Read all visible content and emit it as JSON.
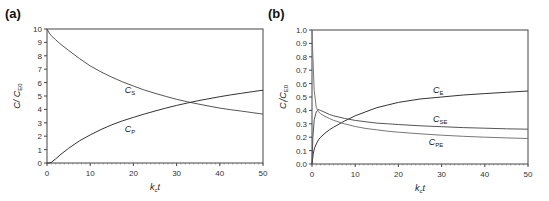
{
  "chart_data": [
    {
      "panel_label": "(a)",
      "type": "line",
      "xlabel": "k_c t",
      "ylabel": "C / C_E0",
      "xlim": [
        0,
        50
      ],
      "ylim": [
        0,
        10
      ],
      "xticks": [
        0,
        10,
        20,
        30,
        40,
        50
      ],
      "yticks": [
        0,
        1,
        2,
        3,
        4,
        5,
        6,
        7,
        8,
        9,
        10
      ],
      "grid": false,
      "series": [
        {
          "name": "C_S",
          "label": "C",
          "sub": "S",
          "label_pos": [
            18,
            5.2
          ],
          "x": [
            0,
            0.5,
            1,
            2,
            3,
            5,
            7.5,
            10,
            12.5,
            15,
            17.5,
            20,
            22.5,
            25,
            27.5,
            30,
            32.5,
            35,
            37.5,
            40,
            42.5,
            45,
            47.5,
            50
          ],
          "y": [
            10,
            9.7,
            9.5,
            9.2,
            8.9,
            8.4,
            7.8,
            7.25,
            6.8,
            6.4,
            6.05,
            5.75,
            5.45,
            5.2,
            4.97,
            4.75,
            4.57,
            4.4,
            4.25,
            4.1,
            3.98,
            3.87,
            3.76,
            3.65
          ]
        },
        {
          "name": "C_P",
          "label": "C",
          "sub": "P",
          "label_pos": [
            18,
            2.3
          ],
          "x": [
            0,
            0.5,
            1,
            2,
            3,
            5,
            7.5,
            10,
            12.5,
            15,
            17.5,
            20,
            22.5,
            25,
            27.5,
            30,
            32.5,
            35,
            37.5,
            40,
            42.5,
            45,
            47.5,
            50
          ],
          "y": [
            0,
            0,
            0.05,
            0.3,
            0.6,
            1.1,
            1.65,
            2.1,
            2.5,
            2.85,
            3.15,
            3.4,
            3.65,
            3.88,
            4.1,
            4.3,
            4.48,
            4.65,
            4.8,
            4.95,
            5.08,
            5.2,
            5.32,
            5.43
          ]
        }
      ]
    },
    {
      "panel_label": "(b)",
      "type": "line",
      "xlabel": "k_c t",
      "ylabel": "C_i / C_E0",
      "xlim": [
        0,
        50
      ],
      "ylim": [
        0,
        1.0
      ],
      "xticks": [
        0,
        10,
        20,
        30,
        40,
        50
      ],
      "yticks": [
        0.0,
        0.1,
        0.2,
        0.3,
        0.4,
        0.5,
        0.6,
        0.7,
        0.8,
        0.9,
        1.0
      ],
      "grid": false,
      "series": [
        {
          "name": "C_E",
          "label": "C",
          "sub": "E",
          "label_pos": [
            28,
            0.53
          ],
          "x": [
            0,
            0.3,
            0.6,
            1,
            1.5,
            2,
            3,
            4,
            5,
            7.5,
            10,
            12.5,
            15,
            17.5,
            20,
            25,
            30,
            35,
            40,
            45,
            50
          ],
          "y": [
            0,
            0.08,
            0.12,
            0.15,
            0.18,
            0.2,
            0.23,
            0.255,
            0.275,
            0.32,
            0.36,
            0.39,
            0.42,
            0.44,
            0.46,
            0.485,
            0.5,
            0.515,
            0.525,
            0.535,
            0.545
          ]
        },
        {
          "name": "C_SE",
          "label": "C",
          "sub": "SE",
          "label_pos": [
            28,
            0.315
          ],
          "x": [
            0,
            0.2,
            0.5,
            1,
            1.5,
            2,
            3,
            4,
            5,
            7.5,
            10,
            12.5,
            15,
            17.5,
            20,
            25,
            30,
            35,
            40,
            45,
            50
          ],
          "y": [
            0,
            0.2,
            0.33,
            0.39,
            0.405,
            0.4,
            0.385,
            0.37,
            0.36,
            0.34,
            0.325,
            0.315,
            0.305,
            0.3,
            0.295,
            0.285,
            0.278,
            0.272,
            0.267,
            0.263,
            0.26
          ]
        },
        {
          "name": "C_PE",
          "label": "C",
          "sub": "PE",
          "label_pos": [
            27,
            0.14
          ],
          "x": [
            0,
            0.2,
            0.5,
            1,
            1.5,
            2,
            3,
            4,
            5,
            7.5,
            10,
            12.5,
            15,
            17.5,
            20,
            25,
            30,
            35,
            40,
            45,
            50
          ],
          "y": [
            1.0,
            0.8,
            0.55,
            0.42,
            0.39,
            0.375,
            0.355,
            0.34,
            0.325,
            0.3,
            0.28,
            0.265,
            0.255,
            0.245,
            0.237,
            0.225,
            0.215,
            0.207,
            0.2,
            0.195,
            0.19
          ]
        }
      ]
    }
  ]
}
